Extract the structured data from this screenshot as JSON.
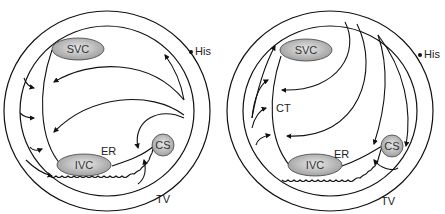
{
  "diagrams": [
    {
      "id": "left",
      "labels": {
        "svc": "SVC",
        "ivc": "IVC",
        "cs": "CS",
        "er": "ER",
        "his": "His",
        "tv": "TV"
      }
    },
    {
      "id": "right",
      "labels": {
        "svc": "SVC",
        "ivc": "IVC",
        "cs": "CS",
        "er": "ER",
        "ct": "CT",
        "his": "His",
        "tv": "TV"
      }
    }
  ],
  "colors": {
    "stroke": "#111111",
    "structure_fill_light": "#e6e6e6",
    "structure_fill_dark": "#9a9a9a",
    "background": "#ffffff"
  }
}
